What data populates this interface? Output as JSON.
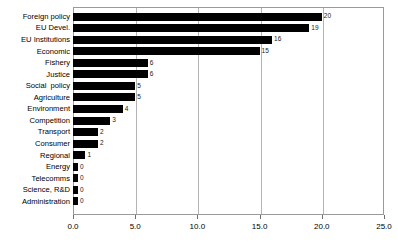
{
  "chart_data": {
    "type": "bar",
    "orientation": "horizontal",
    "title": "",
    "subtitle": "",
    "xlabel": "",
    "ylabel": "",
    "xlim": [
      0.0,
      25.0
    ],
    "xticks": [
      "0.0",
      "5.0",
      "10.0",
      "15.0",
      "20.0",
      "25.0"
    ],
    "xtick_values": [
      0,
      5,
      10,
      15,
      20,
      25
    ],
    "grid": "vertical",
    "legend": "none",
    "bar_color": "#000000",
    "background_color": "#ffffff",
    "frame_color": "#9a9a9a",
    "gridline_color": "#b4b4b4",
    "categories": [
      "Foreign policy",
      "EU Devel.",
      "EU Institutions",
      "Economic",
      "Fishery",
      "Justice",
      "Social  policy",
      "Agriculture",
      "Environment",
      "Competition",
      "Transport",
      "Consumer",
      "Regional",
      "Energy",
      "Telecomms",
      "Science, R&D",
      "Administration"
    ],
    "values": [
      20,
      19,
      16,
      15,
      6,
      6,
      5,
      5,
      4,
      3,
      2,
      2,
      1,
      0,
      0,
      0,
      0
    ],
    "value_labels": [
      "20",
      "19",
      "16",
      "15",
      "6",
      "6",
      "5",
      "5",
      "4",
      "3",
      "2",
      "2",
      "1",
      "0",
      "0",
      "0",
      "0"
    ]
  }
}
